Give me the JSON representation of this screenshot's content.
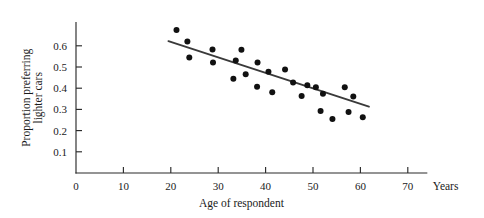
{
  "chart_data": {
    "type": "scatter",
    "title": "",
    "xlabel": "Age of respondent",
    "ylabel": "Proportion preferring lighter cars",
    "ylabel_line1": "Proportion preferring",
    "ylabel_line2": "lighter cars",
    "x_unit_label": "Years",
    "xlim": [
      0,
      74
    ],
    "ylim": [
      0,
      0.7
    ],
    "grid": false,
    "legend": false,
    "x_ticks": [
      0,
      10,
      20,
      30,
      40,
      50,
      60,
      70
    ],
    "x_tick_labels": [
      "0",
      "10",
      "20",
      "30",
      "40",
      "50",
      "60",
      "70"
    ],
    "y_ticks": [
      0.1,
      0.2,
      0.3,
      0.4,
      0.5,
      0.6
    ],
    "y_tick_labels": [
      "0.1",
      "0.2",
      "0.3",
      "0.4",
      "0.5",
      "0.6"
    ],
    "marker": "filled-circle",
    "marker_color": "#111111",
    "points": [
      {
        "x": 21.2,
        "y": 0.675
      },
      {
        "x": 23.5,
        "y": 0.62
      },
      {
        "x": 23.9,
        "y": 0.545
      },
      {
        "x": 28.8,
        "y": 0.583
      },
      {
        "x": 28.9,
        "y": 0.521
      },
      {
        "x": 33.2,
        "y": 0.444
      },
      {
        "x": 33.7,
        "y": 0.531
      },
      {
        "x": 34.9,
        "y": 0.581
      },
      {
        "x": 35.8,
        "y": 0.466
      },
      {
        "x": 38.2,
        "y": 0.407
      },
      {
        "x": 38.3,
        "y": 0.521
      },
      {
        "x": 40.6,
        "y": 0.478
      },
      {
        "x": 41.4,
        "y": 0.381
      },
      {
        "x": 44.1,
        "y": 0.488
      },
      {
        "x": 45.8,
        "y": 0.427
      },
      {
        "x": 47.6,
        "y": 0.363
      },
      {
        "x": 48.8,
        "y": 0.414
      },
      {
        "x": 50.6,
        "y": 0.404
      },
      {
        "x": 51.6,
        "y": 0.292
      },
      {
        "x": 52.1,
        "y": 0.374
      },
      {
        "x": 54.1,
        "y": 0.255
      },
      {
        "x": 56.7,
        "y": 0.404
      },
      {
        "x": 57.5,
        "y": 0.288
      },
      {
        "x": 58.5,
        "y": 0.361
      },
      {
        "x": 60.5,
        "y": 0.263
      }
    ],
    "fit_line": {
      "type": "linear-regression",
      "x_start": 19.5,
      "y_start": 0.622,
      "x_end": 61.8,
      "y_end": 0.313
    }
  }
}
